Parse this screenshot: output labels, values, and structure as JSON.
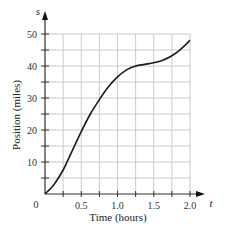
{
  "chart_data": {
    "type": "line",
    "title": "",
    "xlabel": "Time (hours)",
    "ylabel": "Position (miles)",
    "x_axis_var": "t",
    "y_axis_var": "s",
    "origin_label": "0",
    "xlim": [
      0,
      2.0
    ],
    "ylim": [
      0,
      50
    ],
    "x_ticks": [
      0.25,
      0.5,
      0.75,
      1.0,
      1.25,
      1.5,
      1.75,
      2.0
    ],
    "x_tick_labels": [
      "0.5",
      "1.0",
      "1.5",
      "2.0"
    ],
    "x_tick_label_values": [
      0.5,
      1.0,
      1.5,
      2.0
    ],
    "y_ticks": [
      5,
      10,
      15,
      20,
      25,
      30,
      35,
      40,
      45,
      50
    ],
    "y_tick_labels": [
      "10",
      "20",
      "30",
      "40",
      "50"
    ],
    "y_tick_label_values": [
      10,
      20,
      30,
      40,
      50
    ],
    "grid": true,
    "legend": null,
    "series": [
      {
        "name": "s(t)",
        "x": [
          0,
          0.125,
          0.25,
          0.375,
          0.5,
          0.625,
          0.75,
          0.875,
          1.0,
          1.125,
          1.25,
          1.375,
          1.5,
          1.625,
          1.75,
          1.875,
          2.0
        ],
        "values": [
          0,
          3,
          7.5,
          13.5,
          19.5,
          25,
          29.5,
          33.5,
          36.6,
          38.8,
          40,
          40.5,
          41,
          41.8,
          43.2,
          45.3,
          48
        ]
      }
    ],
    "colors": {
      "curve": "#1a1a1a",
      "axes": "#333333",
      "grid": "#cccccc"
    }
  }
}
